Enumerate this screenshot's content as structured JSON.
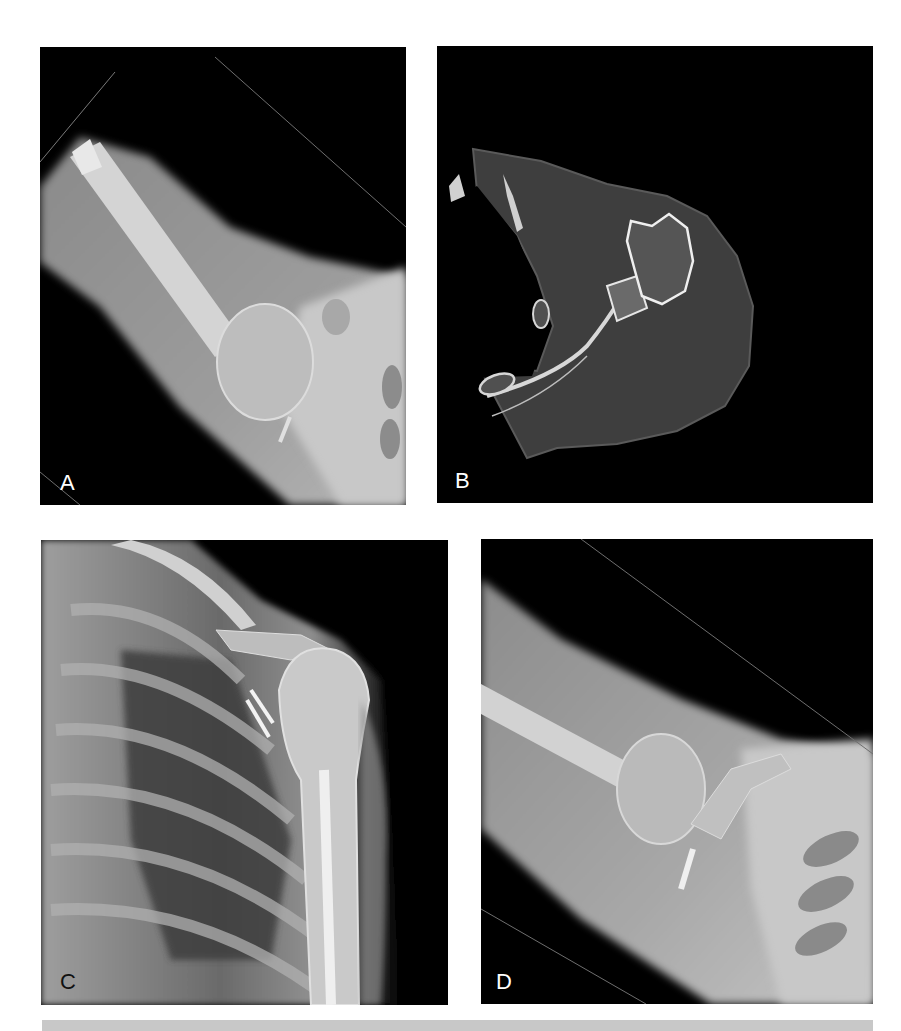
{
  "figure": {
    "panels": [
      {
        "id": "A",
        "label": "A",
        "label_color": "#ffffff",
        "modality": "radiograph",
        "view": "axillary view of shoulder"
      },
      {
        "id": "B",
        "label": "B",
        "label_color": "#ffffff",
        "modality": "CT",
        "view": "axial CT slice of shoulder"
      },
      {
        "id": "C",
        "label": "C",
        "label_color": "#111111",
        "modality": "radiograph",
        "view": "AP view of shoulder and chest"
      },
      {
        "id": "D",
        "label": "D",
        "label_color": "#ffffff",
        "modality": "radiograph",
        "view": "axillary view of shoulder with screw fixation"
      }
    ],
    "background_color": "#ffffff",
    "panel_background": "#000000",
    "caption_bar_color": "#c8c8c8"
  }
}
